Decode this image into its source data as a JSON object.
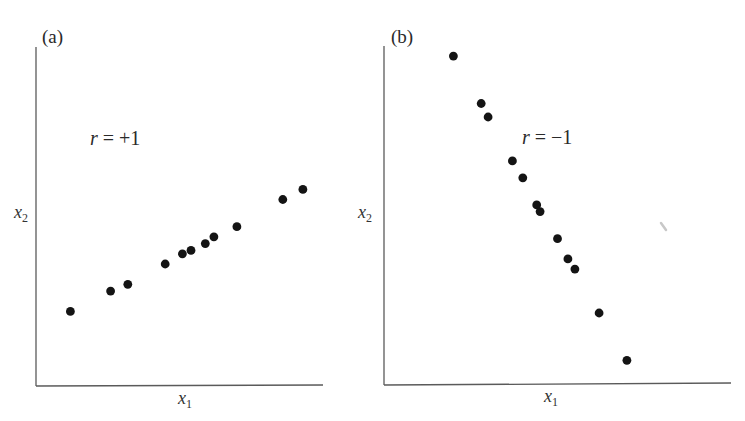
{
  "chart_data": [
    {
      "type": "scatter",
      "panel_label": "(a)",
      "title": "(a)",
      "xlabel": "x1",
      "ylabel": "x2",
      "annotation": "r = +1",
      "grid": false,
      "legend": null,
      "ticks": "none",
      "xlim": [
        0,
        100
      ],
      "ylim": [
        0,
        100
      ],
      "points": [
        {
          "x": 12,
          "y": 22
        },
        {
          "x": 26,
          "y": 28
        },
        {
          "x": 32,
          "y": 30
        },
        {
          "x": 45,
          "y": 36
        },
        {
          "x": 51,
          "y": 39
        },
        {
          "x": 54,
          "y": 40
        },
        {
          "x": 59,
          "y": 42
        },
        {
          "x": 62,
          "y": 44
        },
        {
          "x": 70,
          "y": 47
        },
        {
          "x": 86,
          "y": 55
        },
        {
          "x": 93,
          "y": 58
        }
      ]
    },
    {
      "type": "scatter",
      "panel_label": "(b)",
      "title": "(b)",
      "xlabel": "x1",
      "ylabel": "x2",
      "annotation": "r = -1",
      "grid": false,
      "legend": null,
      "ticks": "none",
      "xlim": [
        0,
        100
      ],
      "ylim": [
        0,
        100
      ],
      "points": [
        {
          "x": 20,
          "y": 97
        },
        {
          "x": 28,
          "y": 83
        },
        {
          "x": 30,
          "y": 79
        },
        {
          "x": 37,
          "y": 66
        },
        {
          "x": 40,
          "y": 61
        },
        {
          "x": 44,
          "y": 53
        },
        {
          "x": 45,
          "y": 51
        },
        {
          "x": 50,
          "y": 43
        },
        {
          "x": 53,
          "y": 37
        },
        {
          "x": 55,
          "y": 34
        },
        {
          "x": 62,
          "y": 21
        },
        {
          "x": 70,
          "y": 7
        }
      ]
    }
  ],
  "panels": [
    {
      "id": "a",
      "label": "(a)",
      "annotation_r": "r",
      "annotation_rest": " = +1",
      "xlabel_main": "x",
      "xlabel_sub": "1",
      "ylabel_main": "x",
      "ylabel_sub": "2"
    },
    {
      "id": "b",
      "label": "(b)",
      "annotation_r": "r",
      "annotation_rest": " = −1",
      "xlabel_main": "x",
      "xlabel_sub": "1",
      "ylabel_main": "x",
      "ylabel_sub": "2"
    }
  ],
  "colors": {
    "dot": "#141414",
    "axis": "#5a5a5a",
    "text": "#2a2a2a",
    "background": "#ffffff"
  }
}
